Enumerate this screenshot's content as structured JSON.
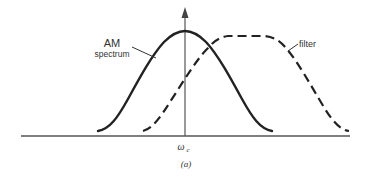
{
  "diagram": {
    "type": "spectrum-sketch",
    "labels": {
      "am_spectrum_line1": "AM",
      "am_spectrum_line2": "spectrum",
      "filter": "filter",
      "center_frequency": "ω",
      "center_frequency_sub": "c",
      "caption": "(a)"
    },
    "curves": [
      {
        "name": "AM spectrum",
        "style": "solid",
        "shape": "bell",
        "center": "ω_c"
      },
      {
        "name": "filter",
        "style": "dashed",
        "shape": "flat-top bandpass",
        "offset": "shifted right of ω_c"
      }
    ],
    "colors": {
      "stroke": "#222222",
      "axis": "#555555",
      "text": "#333333"
    }
  }
}
